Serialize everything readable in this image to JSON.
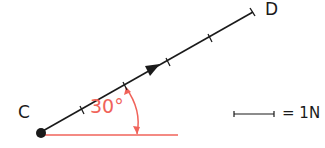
{
  "diagram": {
    "type": "force vector diagram",
    "vector": {
      "start_label": "C",
      "end_label": "D",
      "length_units": 5,
      "color": "#1a1a1a"
    },
    "angle": {
      "label": "30°",
      "value_degrees": 30,
      "color": "#f0635a"
    },
    "scale": {
      "label": "= 1N"
    }
  }
}
